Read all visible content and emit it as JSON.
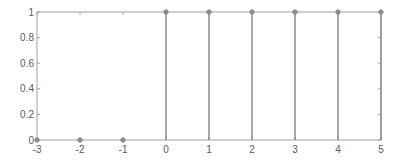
{
  "chart_data": {
    "type": "stem",
    "title": "",
    "xlabel": "",
    "ylabel": "",
    "x": [
      -3,
      -2,
      -1,
      0,
      1,
      2,
      3,
      4,
      5
    ],
    "values": [
      0,
      0,
      0,
      1,
      1,
      1,
      1,
      1,
      1
    ],
    "xlim": [
      -3,
      5
    ],
    "ylim": [
      0,
      1
    ],
    "xticks": [
      "-3",
      "-2",
      "-1",
      "0",
      "1",
      "2",
      "3",
      "4",
      "5"
    ],
    "yticks": [
      "0",
      "0.2",
      "0.4",
      "0.6",
      "0.8",
      "1"
    ],
    "grid": false,
    "legend": null,
    "colors": {
      "axis": "#a0a0a0",
      "stem": "#8c8c8c",
      "marker": "#8c8c8c",
      "text": "#5a5a5a"
    }
  }
}
